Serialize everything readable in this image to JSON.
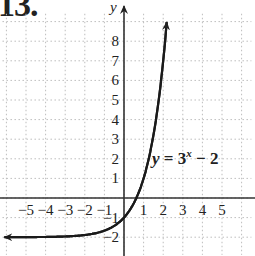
{
  "problem_number": "13.",
  "chart_data": {
    "type": "line",
    "title": "",
    "function": "y = 3^x - 2",
    "equation_label": {
      "prefix": "y = 3",
      "sup": "x",
      "suffix": " − 2"
    },
    "xlabel": "",
    "ylabel": "y",
    "x_ticks": [
      -5,
      -4,
      -3,
      -2,
      -1,
      1,
      2,
      3,
      4,
      5
    ],
    "x_tick_labels": [
      "−5",
      "−4",
      "−3",
      "−2",
      "−1",
      "1",
      "2",
      "3",
      "4",
      "5"
    ],
    "y_ticks": [
      1,
      2,
      3,
      4,
      5,
      6,
      7,
      8,
      -1,
      -2
    ],
    "y_tick_labels": [
      "1",
      "2",
      "3",
      "4",
      "5",
      "6",
      "7",
      "8",
      "−1",
      "−2"
    ],
    "xlim": [
      -6.2,
      6.5
    ],
    "ylim": [
      -2.9,
      9.6
    ],
    "grid": true,
    "grid_style": "dotted",
    "legend": null,
    "points": [
      {
        "x": -6,
        "y": -1.9986
      },
      {
        "x": -5,
        "y": -1.9959
      },
      {
        "x": -4,
        "y": -1.9877
      },
      {
        "x": -3,
        "y": -1.963
      },
      {
        "x": -2,
        "y": -1.889
      },
      {
        "x": -1,
        "y": -1.667
      },
      {
        "x": 0,
        "y": -1
      },
      {
        "x": 0.631,
        "y": 0
      },
      {
        "x": 1,
        "y": 1
      },
      {
        "x": 1.5,
        "y": 3.196
      },
      {
        "x": 2,
        "y": 7
      },
      {
        "x": 2.17,
        "y": 8.8
      }
    ],
    "asymptote": {
      "y": -2
    },
    "arrows": [
      "left",
      "up"
    ]
  },
  "colors": {
    "curve": "#1a1a1a",
    "axis": "#333333",
    "grid": "#bdbdbd",
    "text": "#222222"
  }
}
